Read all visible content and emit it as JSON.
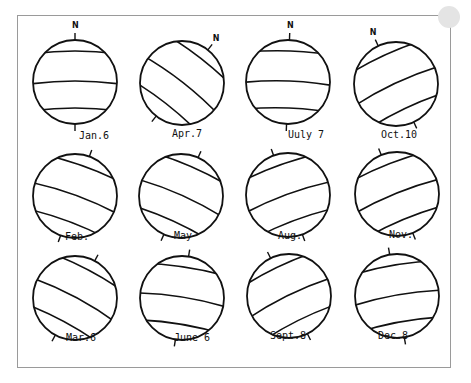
{
  "north_marker": "N",
  "globes": [
    {
      "label": "Jan.6",
      "cx": 75,
      "cy": 82,
      "tilt": 0,
      "north": true,
      "lx": 79,
      "ly": 139
    },
    {
      "label": "Apr.7",
      "cx": 182,
      "cy": 83,
      "tilt": 38,
      "north": true,
      "lx": 172,
      "ly": 137
    },
    {
      "label": "Uuly 7",
      "cx": 288,
      "cy": 82,
      "tilt": 2,
      "north": true,
      "lx": 288,
      "ly": 138
    },
    {
      "label": "Oct.10",
      "cx": 396,
      "cy": 84,
      "tilt": -25,
      "north": true,
      "lx": 381,
      "ly": 138
    },
    {
      "label": "Feb.",
      "cx": 75,
      "cy": 196,
      "tilt": 20,
      "north": false,
      "lx": 65,
      "ly": 240
    },
    {
      "label": "May",
      "cx": 181,
      "cy": 196,
      "tilt": 24,
      "north": false,
      "lx": 174,
      "ly": 239
    },
    {
      "label": "Aug.",
      "cx": 288,
      "cy": 195,
      "tilt": -20,
      "north": false,
      "lx": 278,
      "ly": 239
    },
    {
      "label": "Nov.",
      "cx": 397,
      "cy": 194,
      "tilt": -22,
      "north": false,
      "lx": 389,
      "ly": 238
    },
    {
      "label": "Mar.6",
      "cx": 75,
      "cy": 298,
      "tilt": 28,
      "north": false,
      "lx": 66,
      "ly": 341
    },
    {
      "label": "June 6",
      "cx": 182,
      "cy": 298,
      "tilt": 9,
      "north": false,
      "lx": 174,
      "ly": 341
    },
    {
      "label": "Sept.8",
      "cx": 289,
      "cy": 296,
      "tilt": -26,
      "north": false,
      "lx": 270,
      "ly": 339
    },
    {
      "label": "Dec.8",
      "cx": 397,
      "cy": 296,
      "tilt": -10,
      "north": false,
      "lx": 378,
      "ly": 339
    }
  ],
  "colors": {
    "line": "#111111",
    "frame": "#9a9a9a",
    "background": "#ffffff"
  }
}
